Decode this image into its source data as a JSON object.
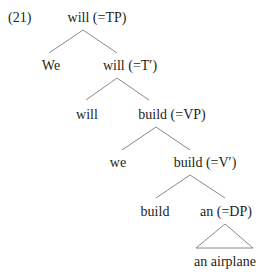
{
  "example_number": "(21)",
  "nodes": {
    "tp": "will (=TP)",
    "spec_tp": "We",
    "t_bar": "will (=T′)",
    "t_head": "will",
    "vp": "build (=VP)",
    "spec_vp": "we",
    "v_bar": "build (=V′)",
    "v_head": "build",
    "dp": "an (=DP)",
    "dp_content": "an airplane"
  },
  "colors": {
    "text": "#231f20",
    "lines": "#8a8a8a"
  }
}
